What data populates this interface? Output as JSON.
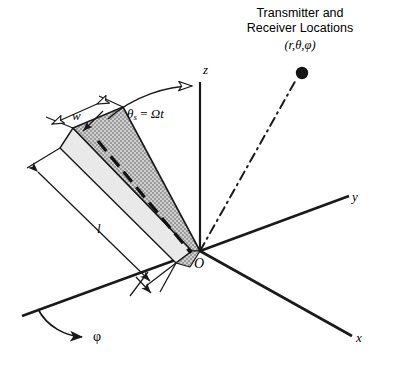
{
  "figure": {
    "kind": "3d-geometry-diagram",
    "background_color": "#ffffff",
    "ink_color": "#1a1a1a",
    "plate_fill_color": "#b9b9b9",
    "plate_edge_color": "#d8d8d8"
  },
  "annotation": {
    "title_line1": "Transmitter and",
    "title_line2": "Receiver Locations",
    "coordinates": "(r,θ,φ)"
  },
  "axes": {
    "z_label": "z",
    "y_label": "y",
    "x_label": "x",
    "origin_label": "O"
  },
  "dimensions": {
    "width_label": "w",
    "length_label": "l"
  },
  "angles": {
    "tilt_symbol": "θ",
    "tilt_subscript": "s",
    "tilt_equals": " = ",
    "tilt_value": "Ωt",
    "tilt_full": "θs = Ωt",
    "azimuth_label": "φ"
  },
  "point": {
    "name": "transmitter-receiver-point",
    "x": 302,
    "y": 73,
    "radius": 6
  }
}
